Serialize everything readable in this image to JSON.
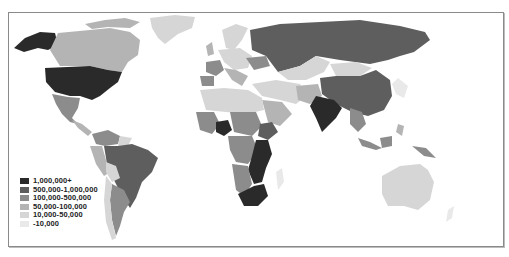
{
  "map": {
    "type": "choropleth",
    "projection": "world",
    "color_scheme": "grayscale"
  },
  "legend": {
    "items": [
      {
        "label": "1,000,000+",
        "color": "#2a2a2a"
      },
      {
        "label": "500,000-1,000,000",
        "color": "#5e5e5e"
      },
      {
        "label": "100,000-500,000",
        "color": "#8c8c8c"
      },
      {
        "label": "50,000-100,000",
        "color": "#b4b4b4"
      },
      {
        "label": "10,000-50,000",
        "color": "#d6d6d6"
      },
      {
        "label": "-10,000",
        "color": "#e9e9e9"
      }
    ]
  },
  "regions": [
    {
      "name": "United States",
      "class": "1,000,000+"
    },
    {
      "name": "Alaska",
      "class": "1,000,000+"
    },
    {
      "name": "Canada",
      "class": "50,000-100,000"
    },
    {
      "name": "Greenland",
      "class": "10,000-50,000"
    },
    {
      "name": "Mexico",
      "class": "100,000-500,000"
    },
    {
      "name": "Brazil",
      "class": "500,000-1,000,000"
    },
    {
      "name": "Colombia/Venezuela",
      "class": "100,000-500,000"
    },
    {
      "name": "Peru",
      "class": "50,000-100,000"
    },
    {
      "name": "Argentina",
      "class": "100,000-500,000"
    },
    {
      "name": "Chile",
      "class": "10,000-50,000"
    },
    {
      "name": "Russia",
      "class": "500,000-1,000,000"
    },
    {
      "name": "China",
      "class": "500,000-1,000,000"
    },
    {
      "name": "India",
      "class": "1,000,000+"
    },
    {
      "name": "Kazakhstan",
      "class": "10,000-50,000"
    },
    {
      "name": "Mongolia",
      "class": "10,000-50,000"
    },
    {
      "name": "France",
      "class": "100,000-500,000"
    },
    {
      "name": "Spain",
      "class": "100,000-500,000"
    },
    {
      "name": "Nigeria",
      "class": "1,000,000+"
    },
    {
      "name": "South Africa",
      "class": "1,000,000+"
    },
    {
      "name": "East Africa",
      "class": "1,000,000+"
    },
    {
      "name": "Ethiopia",
      "class": "500,000-1,000,000"
    },
    {
      "name": "Australia",
      "class": "10,000-50,000"
    },
    {
      "name": "Indonesia",
      "class": "100,000-500,000"
    }
  ]
}
